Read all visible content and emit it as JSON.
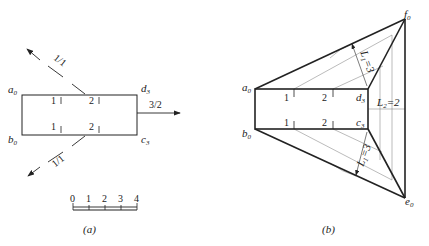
{
  "figure_a": {
    "caption": "(a)",
    "vertices": {
      "a": "a",
      "a_sub": "0",
      "b": "b",
      "b_sub": "0",
      "c": "c",
      "c_sub": "3",
      "d": "d",
      "d_sub": "3"
    },
    "tick_labels_top": [
      "1",
      "2"
    ],
    "tick_labels_bottom": [
      "1",
      "2"
    ],
    "slope_upper": "1/1",
    "slope_lower": "1/1",
    "slope_right": "3/2",
    "scale_labels": [
      "0",
      "1",
      "2",
      "3",
      "4"
    ]
  },
  "figure_b": {
    "caption": "(b)",
    "vertices": {
      "a": "a",
      "a_sub": "0",
      "b": "b",
      "b_sub": "0",
      "c": "c",
      "c_sub": "3",
      "d": "d",
      "d_sub": "3",
      "e": "e",
      "e_sub": "0",
      "f": "f",
      "f_sub": "0"
    },
    "tick_labels_top": [
      "1",
      "2"
    ],
    "tick_labels_bottom": [
      "1",
      "2"
    ],
    "dim_upper": "L",
    "dim_upper_sub": "1",
    "dim_upper_val": "=3",
    "dim_lower": "L",
    "dim_lower_sub": "1",
    "dim_lower_val": "=3",
    "dim_right": "L",
    "dim_right_sub": "2",
    "dim_right_val": "=2"
  },
  "colors": {
    "line": "#222222",
    "thin": "#666666"
  }
}
